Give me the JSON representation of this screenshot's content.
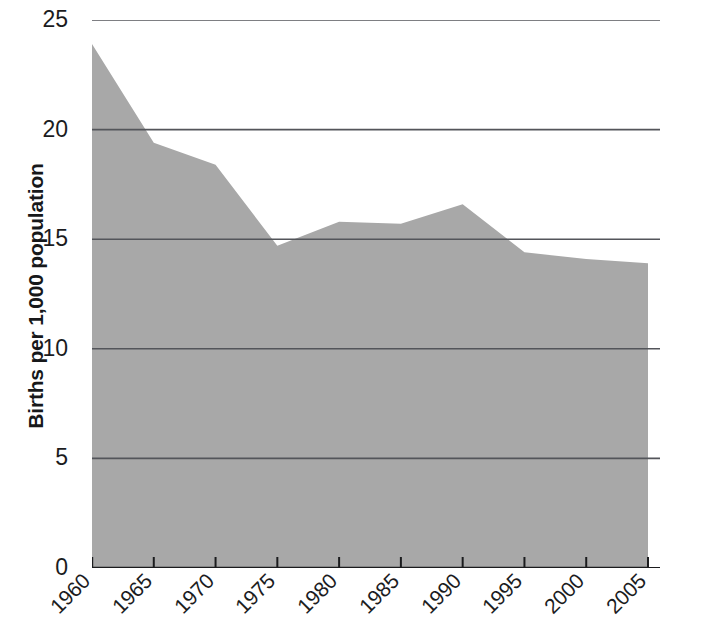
{
  "chart_data": {
    "type": "area",
    "title": "",
    "xlabel": "",
    "ylabel": "Births per 1,000 population",
    "x": [
      1960,
      1965,
      1970,
      1975,
      1980,
      1985,
      1990,
      1995,
      2000,
      2005
    ],
    "categories": [
      "1960",
      "1965",
      "1970",
      "1975",
      "1980",
      "1985",
      "1990",
      "1995",
      "2000",
      "2005"
    ],
    "values": [
      23.9,
      19.4,
      18.4,
      14.7,
      15.8,
      15.7,
      16.6,
      14.4,
      14.1,
      13.9
    ],
    "series": [
      {
        "name": "Birth rate",
        "values": [
          23.9,
          19.4,
          18.4,
          14.7,
          15.8,
          15.7,
          16.6,
          14.4,
          14.1,
          13.9
        ]
      }
    ],
    "ylim": [
      0,
      25
    ],
    "xlim": [
      1960,
      2005
    ],
    "yticks": [
      0,
      5,
      10,
      15,
      20,
      25
    ],
    "ytick_labels": [
      "0",
      "5",
      "10",
      "15",
      "20",
      "25"
    ],
    "xticks": [
      1960,
      1965,
      1970,
      1975,
      1980,
      1985,
      1990,
      1995,
      2000,
      2005
    ],
    "xtick_labels": [
      "1960",
      "1965",
      "1970",
      "1975",
      "1980",
      "1985",
      "1990",
      "1995",
      "2000",
      "2005"
    ],
    "grid": true,
    "grid_axis": "y",
    "legend": false,
    "legend_position": "none",
    "xtick_rotation": -45,
    "colors": {
      "area_fill": "#a8a8a8",
      "gridline": "#53555a",
      "axis": "#1b1c1e",
      "text": "#1b1c1e",
      "background": "#ffffff"
    }
  },
  "attribution": {
    "text": "Wadsworth/Cengage Learning"
  }
}
